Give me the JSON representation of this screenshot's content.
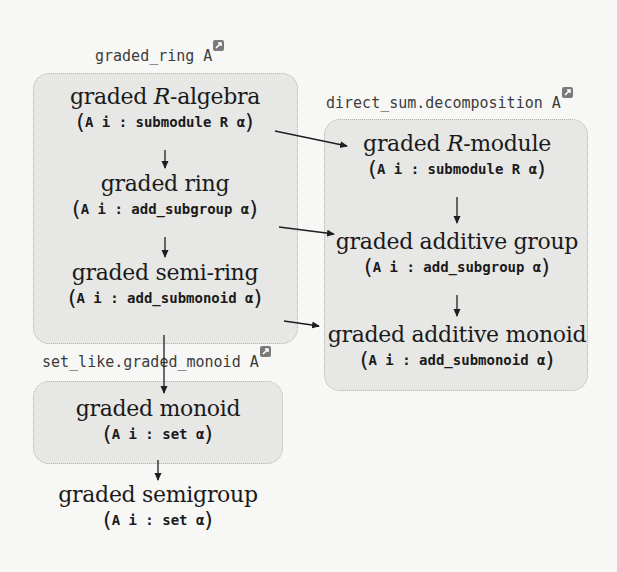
{
  "groups": [
    {
      "id": "graded_ring",
      "label": "graded_ring A",
      "icon": "external-link-icon"
    },
    {
      "id": "direct_sum",
      "label": "direct_sum.decomposition A",
      "icon": "external-link-icon"
    },
    {
      "id": "set_like",
      "label": "set_like.graded_monoid A",
      "icon": "external-link-icon"
    }
  ],
  "nodes": {
    "r_algebra": {
      "title_pre": "graded ",
      "title_var": "R",
      "title_post": "-algebra",
      "type": "A i : submodule R α"
    },
    "ring": {
      "title": "graded ring",
      "type": "A i : add_subgroup α"
    },
    "semi_ring": {
      "title": "graded semi-ring",
      "type": "A i : add_submonoid α"
    },
    "r_module": {
      "title_pre": "graded ",
      "title_var": "R",
      "title_post": "-module",
      "type": "A i : submodule R α"
    },
    "add_group": {
      "title": "graded additive group",
      "type": "A i : add_subgroup α"
    },
    "add_monoid": {
      "title": "graded additive monoid",
      "type": "A i : add_submonoid α"
    },
    "monoid": {
      "title": "graded monoid",
      "type": "A i : set α"
    },
    "semigroup": {
      "title": "graded semigroup",
      "type": "A i : set α"
    }
  },
  "edges": [
    [
      "r_algebra",
      "ring"
    ],
    [
      "ring",
      "semi_ring"
    ],
    [
      "semi_ring",
      "monoid"
    ],
    [
      "monoid",
      "semigroup"
    ],
    [
      "r_module",
      "add_group"
    ],
    [
      "add_group",
      "add_monoid"
    ],
    [
      "r_algebra",
      "r_module"
    ],
    [
      "ring",
      "add_group"
    ],
    [
      "semi_ring",
      "add_monoid"
    ]
  ],
  "colors": {
    "box_fill": "#e7e7e5",
    "box_border": "#b3b3b0",
    "arrow": "#1e1e1e",
    "background": "#f7f7f5"
  }
}
